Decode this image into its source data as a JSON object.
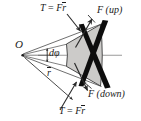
{
  "figure": {
    "background_color": "#ffffff",
    "labels": {
      "torque_top": {
        "equation_lhs": "T",
        "equals": "=",
        "force": "F",
        "radius": "r"
      },
      "torque_bottom": {
        "equation_lhs": "T",
        "equals": "=",
        "force": "F",
        "radius": "r"
      },
      "force_up": "F (up)",
      "force_down": "F (down)",
      "origin": "O",
      "angle": "dφ",
      "mean_radius": "r"
    },
    "colors": {
      "wedge_fill": "#cccbc9",
      "wedge_stroke": "#3a3a3a",
      "bar_fill": "#0d0d0d",
      "centerline": "#9a9a9a",
      "arrow": "#2b2b2b",
      "text": "#1a1a1a"
    },
    "geometry": {
      "origin_x": 22,
      "origin_y": 55,
      "wedge_inner_x": 66,
      "wedge_outer_x": 100,
      "half_angle_deg": 13
    },
    "icon_names": [
      "arrowhead-icon",
      "angle-arrow-icon",
      "centerline-icon",
      "overbar-icon"
    ]
  }
}
